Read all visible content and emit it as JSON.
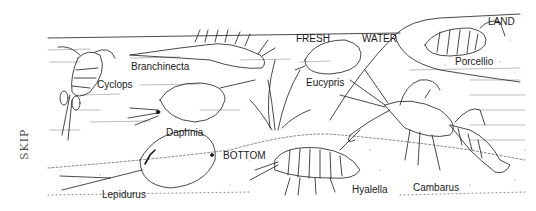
{
  "figure": {
    "type": "scientific line illustration",
    "habitat_labels": {
      "fresh": "FRESH",
      "water": "WATER",
      "land": "LAND",
      "bottom": "BOTTOM"
    },
    "organisms": [
      {
        "name": "Cyclops",
        "habitat": "fresh water"
      },
      {
        "name": "Branchinecta",
        "habitat": "fresh water"
      },
      {
        "name": "Daphnia",
        "habitat": "fresh water"
      },
      {
        "name": "Eucypris",
        "habitat": "fresh water"
      },
      {
        "name": "Porcellio",
        "habitat": "land"
      },
      {
        "name": "Lepidurus",
        "habitat": "bottom"
      },
      {
        "name": "Hyalella",
        "habitat": "bottom"
      },
      {
        "name": "Cambarus",
        "habitat": "bottom"
      }
    ],
    "margin_note": "SKIP",
    "colors": {
      "ink": "#1a1a1a",
      "background": "#ffffff",
      "stipple": "#888888"
    }
  }
}
